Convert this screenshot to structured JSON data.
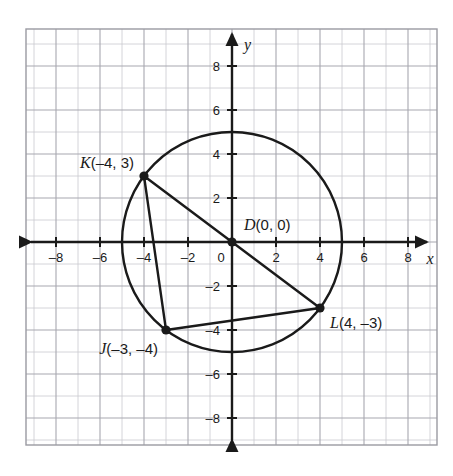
{
  "figure": {
    "title": "",
    "background_color": "#ffffff"
  },
  "chart_data": {
    "type": "scatter",
    "title": "",
    "xlabel": "x",
    "ylabel": "y",
    "xlim": [
      -9.5,
      9.5
    ],
    "ylim": [
      -9.5,
      9.5
    ],
    "grid": true,
    "grid_step": 1,
    "legend": "none",
    "x_ticks": [
      -8,
      -6,
      -4,
      -2,
      0,
      2,
      4,
      6,
      8
    ],
    "y_ticks": [
      8,
      6,
      4,
      2,
      0,
      -2,
      -4,
      -6,
      -8
    ],
    "x_tick_labels": [
      "–8",
      "–6",
      "–4",
      "–2",
      "0",
      "2",
      "4",
      "6",
      "8"
    ],
    "y_tick_labels": [
      "8",
      "6",
      "4",
      "2",
      "0",
      "–2",
      "–4",
      "–6",
      "–8"
    ],
    "circles": [
      {
        "name": "circle-D",
        "center": [
          0,
          0
        ],
        "radius": 5,
        "stroke": "#1a1a1a"
      }
    ],
    "points": [
      {
        "name": "D",
        "label": "D(0, 0)",
        "x": 0,
        "y": 0
      },
      {
        "name": "K",
        "label": "K(–4, 3)",
        "x": -4,
        "y": 3
      },
      {
        "name": "J",
        "label": "J(–3, –4)",
        "x": -3,
        "y": -4
      },
      {
        "name": "L",
        "label": "L(4, –3)",
        "x": 4,
        "y": -3
      }
    ],
    "segments": [
      {
        "name": "segment-KL",
        "from": "K",
        "to": "L",
        "points": [
          [
            -4,
            3
          ],
          [
            4,
            -3
          ]
        ]
      },
      {
        "name": "segment-KJ",
        "from": "K",
        "to": "J",
        "points": [
          [
            -4,
            3
          ],
          [
            -3,
            -4
          ]
        ]
      },
      {
        "name": "segment-JL",
        "from": "J",
        "to": "L",
        "points": [
          [
            -3,
            -4
          ],
          [
            4,
            -3
          ]
        ]
      }
    ]
  },
  "labels": {
    "axis_x": "x",
    "axis_y": "y",
    "point_D": "D(0, 0)",
    "point_D_letter": "D",
    "point_D_coords": "(0, 0)",
    "point_K_letter": "K",
    "point_K_coords": "(–4, 3)",
    "point_J_letter": "J",
    "point_J_coords": "(–3, –4)",
    "point_L_letter": "L",
    "point_L_coords": "(4, –3)"
  },
  "colors": {
    "ink": "#1a1a1a",
    "grid_minor": "#c9c9cf",
    "grid_major": "#a8a8b0",
    "frame": "#9a9aa2",
    "background": "#ffffff"
  }
}
